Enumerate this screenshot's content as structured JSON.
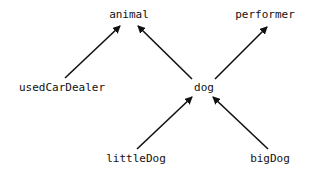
{
  "diagram": {
    "type": "inheritance-graph",
    "colors": {
      "background": "#ffffff",
      "text": "#111111",
      "edge": "#111111"
    },
    "nodes": [
      {
        "id": "animal",
        "label": "animal",
        "x": 129,
        "y": 15
      },
      {
        "id": "performer",
        "label": "performer",
        "x": 265,
        "y": 15
      },
      {
        "id": "usedCarDealer",
        "label": "usedCarDealer",
        "x": 62,
        "y": 88
      },
      {
        "id": "dog",
        "label": "dog",
        "x": 204,
        "y": 88
      },
      {
        "id": "littleDog",
        "label": "littleDog",
        "x": 136,
        "y": 159
      },
      {
        "id": "bigDog",
        "label": "bigDog",
        "x": 270,
        "y": 159
      }
    ],
    "edges": [
      {
        "from": "usedCarDealer",
        "to": "animal",
        "x1": 65,
        "y1": 78,
        "x2": 120,
        "y2": 26
      },
      {
        "from": "dog",
        "to": "animal",
        "x1": 192,
        "y1": 79,
        "x2": 138,
        "y2": 26
      },
      {
        "from": "dog",
        "to": "performer",
        "x1": 215,
        "y1": 79,
        "x2": 267,
        "y2": 27
      },
      {
        "from": "littleDog",
        "to": "dog",
        "x1": 137,
        "y1": 149,
        "x2": 192,
        "y2": 97
      },
      {
        "from": "bigDog",
        "to": "dog",
        "x1": 268,
        "y1": 149,
        "x2": 213,
        "y2": 97
      }
    ]
  }
}
